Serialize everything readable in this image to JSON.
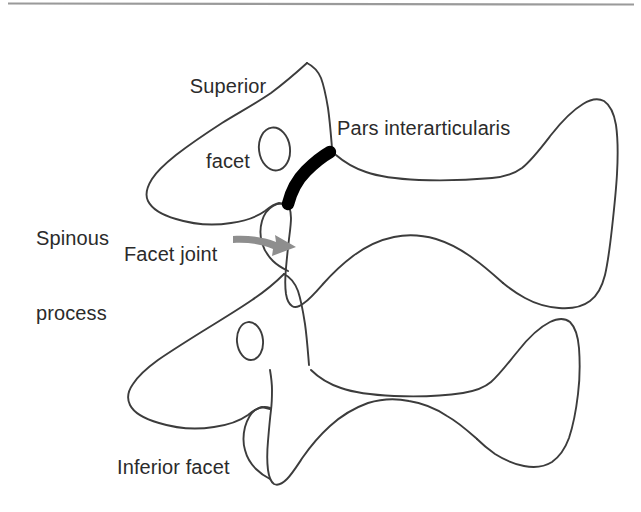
{
  "figure": {
    "kind": "anatomical-line-drawing",
    "background_color": "#ffffff",
    "outline_color": "#3c3c3c",
    "highlight_color": "#000000",
    "arrow_color": "#8e8e8e",
    "rule_color": "#9a9a9a",
    "text_color": "#2b2b2b"
  },
  "top_rule": {
    "present": true,
    "x1": 8,
    "y1": 3,
    "x2": 634,
    "y2": 4
  },
  "labels": {
    "superior_facet": "Superior\nfacet",
    "superior_facet_line1": "Superior",
    "superior_facet_line2": "facet",
    "pars_interarticularis": "Pars interarticularis",
    "spinous_process": "Spinous\nprocess",
    "spinous_process_line1": "Spinous",
    "spinous_process_line2": "process",
    "facet_joint": "Facet joint",
    "inferior_facet": "Inferior facet"
  },
  "annotations": {
    "pars_highlight": {
      "description": "Thick black band marking the pars interarticularis (dog's neck/collar)",
      "from": [
        287,
        206
      ],
      "to": [
        331,
        151
      ]
    },
    "facet_joint_arrow": {
      "description": "Gray curved arrow pointing from the Facet joint label to the facet joint space",
      "from": [
        234,
        239
      ],
      "to": [
        294,
        249
      ]
    }
  },
  "structures": [
    {
      "name": "upper-vertebra",
      "parts": [
        "spinous process (head/snout)",
        "superior facet (ear)",
        "pedicle (eye)",
        "pars interarticularis (neck)",
        "transverse process (body)",
        "inferior facet (front leg)"
      ]
    },
    {
      "name": "lower-vertebra",
      "parts": [
        "spinous process (head/snout)",
        "superior facet (ear)",
        "pedicle (eye)",
        "transverse process (body)",
        "inferior facet (front leg)"
      ]
    }
  ]
}
